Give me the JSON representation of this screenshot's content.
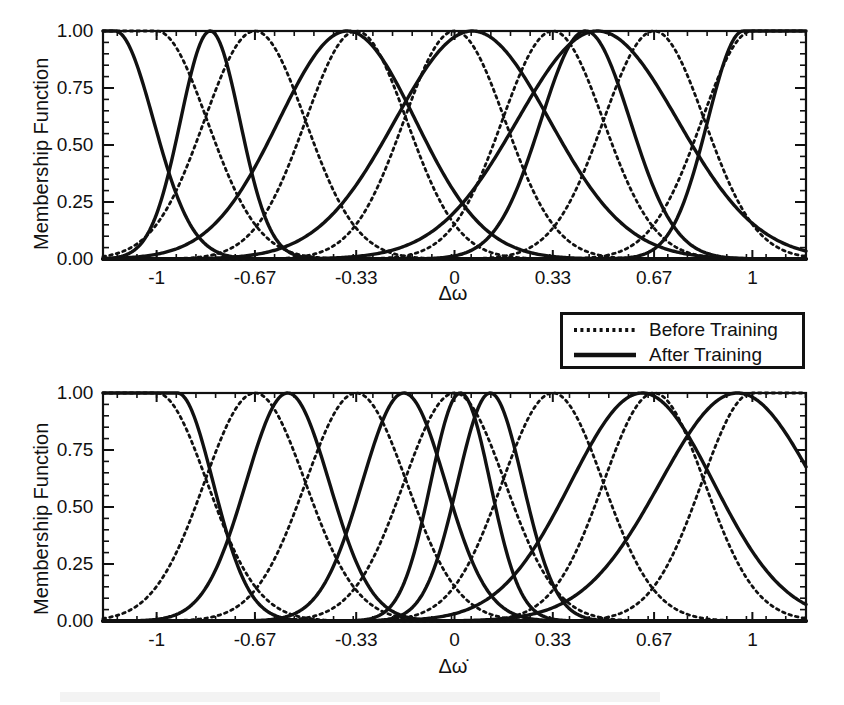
{
  "figure": {
    "title": "",
    "panels": [
      "top",
      "bottom"
    ]
  },
  "legend": {
    "position": "below-top-panel-right",
    "entries": [
      {
        "label": "Before Training",
        "style": "dotted"
      },
      {
        "label": "After Training",
        "style": "solid"
      }
    ]
  },
  "chart_data": [
    {
      "id": "top",
      "type": "line",
      "title": "",
      "xlabel": "Δω",
      "ylabel": "Membership Function",
      "xlim": [
        -1.18,
        1.18
      ],
      "ylim": [
        0.0,
        1.0
      ],
      "grid": false,
      "legend_position": "outside-bottom-right",
      "xticks": [
        -1,
        -0.67,
        -0.33,
        0,
        0.33,
        0.67,
        1
      ],
      "xticklabels": [
        "-1",
        "-0.67",
        "-0.33",
        "0",
        "0.33",
        "0.67",
        "1"
      ],
      "yticks": [
        0.0,
        0.25,
        0.5,
        0.75,
        1.0
      ],
      "yticklabels": [
        "0.00",
        "0.25",
        "0.50",
        "0.75",
        "1.00"
      ],
      "x_minor_tick_count": 4,
      "y_minor_tick_count": 4,
      "series": [
        {
          "name": "Before Training",
          "style": "dotted",
          "description": "Seven uniformly spaced Gaussian membership functions; end sets saturate at 1.0",
          "members": [
            {
              "center": -1.0,
              "sigma": 0.17,
              "shoulder": "left"
            },
            {
              "center": -0.67,
              "sigma": 0.17,
              "shoulder": "none"
            },
            {
              "center": -0.33,
              "sigma": 0.17,
              "shoulder": "none"
            },
            {
              "center": 0.0,
              "sigma": 0.17,
              "shoulder": "none"
            },
            {
              "center": 0.33,
              "sigma": 0.17,
              "shoulder": "none"
            },
            {
              "center": 0.67,
              "sigma": 0.17,
              "shoulder": "none"
            },
            {
              "center": 1.0,
              "sigma": 0.17,
              "shoulder": "right"
            }
          ]
        },
        {
          "name": "After Training",
          "style": "solid",
          "description": "Seven tuned membership functions with shifted centers and altered widths",
          "members": [
            {
              "center": -1.14,
              "sigma": 0.13,
              "shoulder": "left"
            },
            {
              "center": -0.82,
              "sigma": 0.1,
              "shoulder": "none"
            },
            {
              "center": -0.36,
              "sigma": 0.23,
              "shoulder": "none"
            },
            {
              "center": 0.06,
              "sigma": 0.26,
              "shoulder": "none"
            },
            {
              "center": 0.44,
              "sigma": 0.15,
              "shoulder": "none"
            },
            {
              "center": 0.48,
              "sigma": 0.27,
              "shoulder": "none"
            },
            {
              "center": 0.97,
              "sigma": 0.12,
              "shoulder": "right"
            }
          ]
        }
      ]
    },
    {
      "id": "bottom",
      "type": "line",
      "title": "",
      "xlabel": "Δω̇",
      "ylabel": "Membership Function",
      "xlim": [
        -1.18,
        1.18
      ],
      "ylim": [
        0.0,
        1.0
      ],
      "grid": false,
      "legend_position": "shared-with-top-panel",
      "xticks": [
        -1,
        -0.67,
        -0.33,
        0,
        0.33,
        0.67,
        1
      ],
      "xticklabels": [
        "-1",
        "-0.67",
        "-0.33",
        "0",
        "0.33",
        "0.67",
        "1"
      ],
      "yticks": [
        0.0,
        0.25,
        0.5,
        0.75,
        1.0
      ],
      "yticklabels": [
        "0.00",
        "0.25",
        "0.50",
        "0.75",
        "1.00"
      ],
      "x_minor_tick_count": 4,
      "y_minor_tick_count": 4,
      "series": [
        {
          "name": "Before Training",
          "style": "dotted",
          "description": "Seven uniformly spaced Gaussian membership functions; end sets saturate at 1.0",
          "members": [
            {
              "center": -1.0,
              "sigma": 0.17,
              "shoulder": "left"
            },
            {
              "center": -0.67,
              "sigma": 0.17,
              "shoulder": "none"
            },
            {
              "center": -0.33,
              "sigma": 0.17,
              "shoulder": "none"
            },
            {
              "center": 0.0,
              "sigma": 0.17,
              "shoulder": "none"
            },
            {
              "center": 0.33,
              "sigma": 0.17,
              "shoulder": "none"
            },
            {
              "center": 0.67,
              "sigma": 0.17,
              "shoulder": "none"
            },
            {
              "center": 1.0,
              "sigma": 0.17,
              "shoulder": "right"
            }
          ]
        },
        {
          "name": "After Training",
          "style": "solid",
          "description": "Seven tuned membership functions; rightmost set is truncated at the plot edge near 0.27",
          "members": [
            {
              "center": -0.93,
              "sigma": 0.12,
              "shoulder": "left"
            },
            {
              "center": -0.56,
              "sigma": 0.14,
              "shoulder": "none"
            },
            {
              "center": -0.17,
              "sigma": 0.14,
              "shoulder": "none"
            },
            {
              "center": 0.02,
              "sigma": 0.1,
              "shoulder": "none"
            },
            {
              "center": 0.12,
              "sigma": 0.11,
              "shoulder": "none"
            },
            {
              "center": 0.63,
              "sigma": 0.24,
              "shoulder": "none"
            },
            {
              "center": 0.95,
              "sigma": 0.26,
              "shoulder": "none"
            }
          ]
        }
      ]
    }
  ]
}
